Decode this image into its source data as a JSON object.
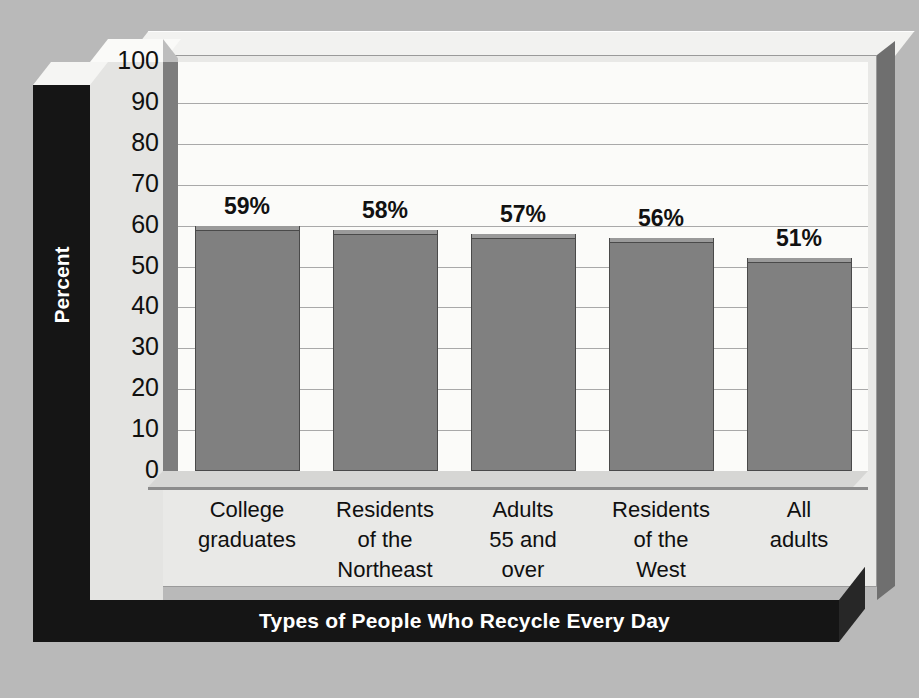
{
  "chart_data": {
    "type": "bar",
    "title": "",
    "xlabel": "Types of People Who Recycle Every Day",
    "ylabel": "Percent",
    "ylim": [
      0,
      100
    ],
    "ytick_step": 10,
    "yticks": [
      "100",
      "90",
      "80",
      "70",
      "60",
      "50",
      "40",
      "30",
      "20",
      "10",
      "0"
    ],
    "grid": true,
    "legend": "none",
    "categories": [
      "College graduates",
      "Residents of the Northeast",
      "Adults 55 and over",
      "Residents of the West",
      "All adults"
    ],
    "category_lines": [
      [
        "College",
        "graduates"
      ],
      [
        "Residents",
        "of the",
        "Northeast"
      ],
      [
        "Adults",
        "55 and",
        "over"
      ],
      [
        "Residents",
        "of the",
        "West"
      ],
      [
        "All",
        "adults"
      ]
    ],
    "values": [
      59,
      58,
      57,
      56,
      51
    ],
    "value_labels": [
      "59%",
      "58%",
      "57%",
      "56%",
      "51%"
    ],
    "units": "percent"
  },
  "colors": {
    "canvas_background": "#b9b9b9",
    "panel_face": "#e9e9e7",
    "plot_background": "#fbfbf9",
    "bar_fill": "#808080",
    "bar_outline": "#4a4a4a",
    "gridline": "#a9a9a9",
    "band_background": "#151515",
    "band_text": "#ffffff",
    "tick_text": "#101010"
  }
}
